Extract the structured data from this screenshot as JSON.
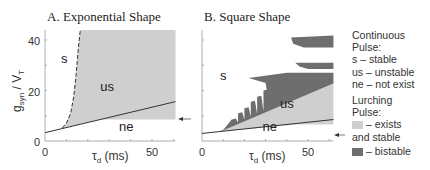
{
  "chart_data": [
    {
      "type": "area",
      "title": "A. Exponential Shape",
      "xlabel": "τ_d (ms)",
      "ylabel": "g_syn / V_T",
      "xlim": [
        0,
        61
      ],
      "ylim": [
        0,
        44
      ],
      "xticks": [
        0,
        50
      ],
      "yticks": [
        0,
        20,
        40
      ],
      "region_labels": [
        {
          "text": "s",
          "x": 9,
          "y": 31
        },
        {
          "text": "us",
          "x": 29,
          "y": 20
        },
        {
          "text": "ne",
          "x": 38,
          "y": 4
        }
      ],
      "boundaries": {
        "ne_boundary_solid": {
          "x": [
            0,
            61
          ],
          "y": [
            3.3,
            15.6
          ]
        },
        "stability_boundary_dashed": {
          "x": [
            8,
            10,
            12,
            13.5,
            14.5,
            15.5,
            16.5
          ],
          "y": [
            5.2,
            7,
            11,
            18,
            26,
            36,
            44
          ]
        }
      },
      "lurching_exists_stable_region": {
        "x_from": 8,
        "x_to": 61,
        "y_bottom_at_right": 8.5,
        "y_top": 44
      },
      "arrow_marker_y": 8.5
    },
    {
      "type": "area",
      "title": "B. Square Shape",
      "xlabel": "τ_d (ms)",
      "xlim": [
        0,
        62
      ],
      "ylim": [
        0,
        44
      ],
      "xticks": [
        0,
        50
      ],
      "region_labels": [
        {
          "text": "s",
          "x": 10,
          "y": 24
        },
        {
          "text": "us",
          "x": 40,
          "y": 13
        },
        {
          "text": "ne",
          "x": 32,
          "y": 4
        }
      ],
      "boundaries": {
        "ne_boundary_solid": {
          "x": [
            0,
            62
          ],
          "y": [
            3,
            8.5
          ]
        },
        "us_upper_boundary": {
          "x": [
            9,
            62
          ],
          "y": [
            4,
            23
          ]
        }
      },
      "bistable_bands": [
        {
          "x_from": 42,
          "x_to": 62,
          "y_range": [
            37,
            41.5
          ]
        },
        {
          "x_from": 44,
          "x_to": 62,
          "y_range": [
            28.5,
            31
          ]
        },
        {
          "x_from": 23,
          "x_to": 62,
          "y_range": [
            17,
            27
          ]
        }
      ]
    }
  ],
  "legend": {
    "continuous_title_1": "Continuous",
    "continuous_title_2": "Pulse:",
    "items": [
      "s – stable",
      "us – unstable",
      "ne – not exist"
    ],
    "lurching_title_1": "Lurching",
    "lurching_title_2": "Pulse:",
    "light_label": "– exists",
    "light_label_2": "and stable",
    "dark_label": "– bistable"
  },
  "colors": {
    "light_region": "#cfcfcf",
    "dark_region": "#6e6e6e",
    "line": "#333333"
  }
}
